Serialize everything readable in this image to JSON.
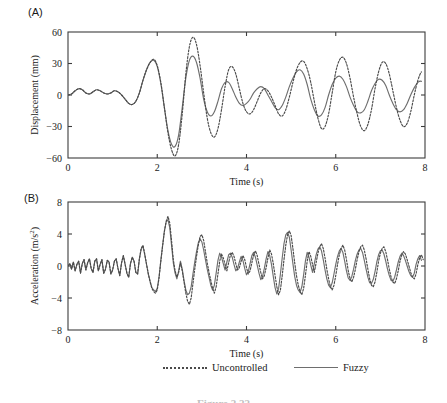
{
  "figure": {
    "caption": "Figure 2.22",
    "panels": [
      {
        "id": "A",
        "label": "(A)"
      },
      {
        "id": "B",
        "label": "(B)"
      }
    ]
  },
  "legend": {
    "position": "bottom-center",
    "entries": [
      {
        "label": "Uncontrolled",
        "style": "dotted",
        "color": "#4a4a4a",
        "icon": "dotted-line-icon"
      },
      {
        "label": "Fuzzy",
        "style": "solid",
        "color": "#6e6e6e",
        "icon": "solid-line-icon"
      }
    ]
  },
  "chart_data": [
    {
      "type": "line",
      "panel": "A",
      "title": "",
      "xlabel": "Time (s)",
      "ylabel": "Displacement (mm)",
      "xlim": [
        0,
        8
      ],
      "ylim": [
        -60,
        60
      ],
      "xticks": [
        0,
        2,
        4,
        6,
        8
      ],
      "yticks": [
        -60,
        -30,
        0,
        30,
        60
      ],
      "xticklabels": [
        "0",
        "2",
        "4",
        "6",
        "8"
      ],
      "yticklabels": [
        "-60",
        "-30",
        "0",
        "30",
        "60"
      ],
      "grid": false,
      "legend": [
        "Uncontrolled",
        "Fuzzy"
      ],
      "x": [
        0.0,
        0.08,
        0.16,
        0.24,
        0.32,
        0.4,
        0.48,
        0.56,
        0.64,
        0.72,
        0.8,
        0.88,
        0.96,
        1.04,
        1.12,
        1.2,
        1.28,
        1.36,
        1.44,
        1.52,
        1.6,
        1.68,
        1.76,
        1.84,
        1.92,
        2.0,
        2.08,
        2.16,
        2.24,
        2.32,
        2.4,
        2.48,
        2.56,
        2.64,
        2.72,
        2.8,
        2.88,
        2.96,
        3.04,
        3.12,
        3.2,
        3.28,
        3.36,
        3.44,
        3.52,
        3.6,
        3.68,
        3.76,
        3.84,
        3.92,
        4.0,
        4.08,
        4.16,
        4.24,
        4.32,
        4.4,
        4.48,
        4.56,
        4.64,
        4.72,
        4.8,
        4.88,
        4.96,
        5.04,
        5.12,
        5.2,
        5.28,
        5.36,
        5.44,
        5.52,
        5.6,
        5.68,
        5.76,
        5.84,
        5.92,
        6.0,
        6.08,
        6.16,
        6.24,
        6.32,
        6.4,
        6.48,
        6.56,
        6.64,
        6.72,
        6.8,
        6.88,
        6.96,
        7.04,
        7.12,
        7.2,
        7.28,
        7.36,
        7.44,
        7.52,
        7.6,
        7.68,
        7.76,
        7.84,
        7.92,
        8.0
      ],
      "series": [
        {
          "name": "Uncontrolled",
          "values": [
            0,
            1,
            4,
            6,
            5,
            2,
            1,
            3,
            5,
            4,
            2,
            1,
            2,
            4,
            3,
            0,
            -4,
            -8,
            -9,
            -6,
            2,
            14,
            24,
            31,
            34,
            28,
            12,
            -12,
            -36,
            -52,
            -58,
            -47,
            -18,
            20,
            46,
            55,
            48,
            28,
            2,
            -22,
            -36,
            -40,
            -32,
            -14,
            8,
            24,
            27,
            20,
            6,
            -8,
            -16,
            -18,
            -14,
            -6,
            2,
            6,
            4,
            -2,
            -10,
            -18,
            -20,
            -14,
            -2,
            12,
            24,
            31,
            32,
            25,
            12,
            -6,
            -22,
            -32,
            -30,
            -18,
            2,
            22,
            33,
            36,
            30,
            16,
            -2,
            -18,
            -30,
            -34,
            -28,
            -14,
            6,
            22,
            31,
            30,
            20,
            4,
            -12,
            -24,
            -30,
            -27,
            -16,
            0,
            14,
            22,
            24,
            18,
            4
          ]
        },
        {
          "name": "Fuzzy",
          "values": [
            0,
            1,
            4,
            6,
            5,
            2,
            1,
            3,
            5,
            4,
            2,
            1,
            2,
            4,
            3,
            0,
            -4,
            -8,
            -9,
            -6,
            2,
            14,
            24,
            31,
            33,
            27,
            11,
            -12,
            -34,
            -47,
            -49,
            -38,
            -12,
            16,
            33,
            37,
            31,
            16,
            -4,
            -16,
            -20,
            -16,
            -6,
            6,
            12,
            12,
            6,
            -2,
            -8,
            -10,
            -8,
            -4,
            2,
            6,
            8,
            6,
            0,
            -6,
            -12,
            -14,
            -10,
            -2,
            8,
            16,
            22,
            24,
            20,
            10,
            -4,
            -14,
            -20,
            -19,
            -12,
            0,
            10,
            16,
            18,
            15,
            8,
            -2,
            -10,
            -16,
            -17,
            -14,
            -6,
            4,
            11,
            15,
            14,
            9,
            0,
            -8,
            -14,
            -16,
            -14,
            -8,
            0,
            7,
            12,
            13,
            9,
            1
          ]
        }
      ]
    },
    {
      "type": "line",
      "panel": "B",
      "title": "",
      "xlabel": "Time (s)",
      "ylabel": "Acceleration (m/s²)",
      "xlim": [
        0,
        8
      ],
      "ylim": [
        -8,
        8
      ],
      "xticks": [
        0,
        2,
        4,
        6,
        8
      ],
      "yticks": [
        -8,
        -4,
        0,
        4,
        8
      ],
      "xticklabels": [
        "0",
        "2",
        "4",
        "6",
        "8"
      ],
      "yticklabels": [
        "-8",
        "-4",
        "0",
        "4",
        "8"
      ],
      "grid": false,
      "legend": [
        "Uncontrolled",
        "Fuzzy"
      ],
      "x": [
        0.0,
        0.04,
        0.08,
        0.12,
        0.16,
        0.2,
        0.24,
        0.28,
        0.32,
        0.36,
        0.4,
        0.44,
        0.48,
        0.52,
        0.56,
        0.6,
        0.64,
        0.68,
        0.72,
        0.76,
        0.8,
        0.84,
        0.88,
        0.92,
        0.96,
        1.0,
        1.04,
        1.08,
        1.12,
        1.16,
        1.2,
        1.24,
        1.28,
        1.32,
        1.36,
        1.4,
        1.44,
        1.48,
        1.52,
        1.56,
        1.6,
        1.64,
        1.68,
        1.72,
        1.76,
        1.8,
        1.84,
        1.88,
        1.92,
        1.96,
        2.0,
        2.04,
        2.08,
        2.12,
        2.16,
        2.2,
        2.24,
        2.28,
        2.32,
        2.36,
        2.4,
        2.44,
        2.48,
        2.52,
        2.56,
        2.6,
        2.64,
        2.68,
        2.72,
        2.76,
        2.8,
        2.84,
        2.88,
        2.92,
        2.96,
        3.0,
        3.04,
        3.08,
        3.12,
        3.16,
        3.2,
        3.24,
        3.28,
        3.32,
        3.36,
        3.4,
        3.44,
        3.48,
        3.52,
        3.56,
        3.6,
        3.64,
        3.68,
        3.72,
        3.76,
        3.8,
        3.84,
        3.88,
        3.92,
        3.96,
        4.0,
        4.04,
        4.08,
        4.12,
        4.16,
        4.2,
        4.24,
        4.28,
        4.32,
        4.36,
        4.4,
        4.44,
        4.48,
        4.52,
        4.56,
        4.6,
        4.64,
        4.68,
        4.72,
        4.76,
        4.8,
        4.84,
        4.88,
        4.92,
        4.96,
        5.0,
        5.04,
        5.08,
        5.12,
        5.16,
        5.2,
        5.24,
        5.28,
        5.32,
        5.36,
        5.4,
        5.44,
        5.48,
        5.52,
        5.56,
        5.6,
        5.64,
        5.68,
        5.72,
        5.76,
        5.8,
        5.84,
        5.88,
        5.92,
        5.96,
        6.0,
        6.04,
        6.08,
        6.12,
        6.16,
        6.2,
        6.24,
        6.28,
        6.32,
        6.36,
        6.4,
        6.44,
        6.48,
        6.52,
        6.56,
        6.6,
        6.64,
        6.68,
        6.72,
        6.76,
        6.8,
        6.84,
        6.88,
        6.92,
        6.96,
        7.0,
        7.04,
        7.08,
        7.12,
        7.16,
        7.2,
        7.24,
        7.28,
        7.32,
        7.36,
        7.4,
        7.44,
        7.48,
        7.52,
        7.56,
        7.6,
        7.64,
        7.68,
        7.72,
        7.76,
        7.8,
        7.84,
        7.88,
        7.92,
        7.96,
        8.0
      ],
      "series": [
        {
          "name": "Uncontrolled",
          "values": [
            0,
            0.3,
            -0.4,
            0.5,
            -0.6,
            0.2,
            0.6,
            -0.9,
            0.3,
            0.8,
            -0.5,
            0.4,
            0.9,
            -0.3,
            -0.8,
            0.6,
            0.9,
            -0.6,
            0.2,
            0.8,
            -0.9,
            -0.4,
            0.7,
            0.5,
            -1.0,
            -0.5,
            0.6,
            0.9,
            -0.3,
            -1.2,
            0.4,
            1.3,
            0.2,
            -0.9,
            -1.4,
            0.3,
            1.1,
            0.6,
            -0.8,
            -1.0,
            0.9,
            2.2,
            2.6,
            1.5,
            0.2,
            -1.0,
            -2.0,
            -2.8,
            -3.2,
            -3.4,
            -3.0,
            -1.5,
            0.6,
            2.5,
            4.3,
            5.6,
            6.2,
            5.4,
            3.2,
            0.8,
            -0.6,
            -1.4,
            -0.8,
            0.4,
            -0.6,
            -2.0,
            -3.4,
            -4.4,
            -4.8,
            -4.0,
            -2.2,
            -0.4,
            1.2,
            2.6,
            3.7,
            3.9,
            3.2,
            1.8,
            0.4,
            -0.8,
            -1.8,
            -2.8,
            -3.4,
            -2.6,
            -1.0,
            0.6,
            1.5,
            1.0,
            0.2,
            -0.6,
            0.4,
            1.4,
            1.7,
            1.2,
            0.3,
            -0.5,
            -0.2,
            0.6,
            1.3,
            0.8,
            -0.2,
            -1.0,
            -0.6,
            0.4,
            1.4,
            1.9,
            1.3,
            0.2,
            -0.8,
            -1.6,
            -1.2,
            -0.2,
            1.0,
            2.0,
            1.5,
            0.3,
            -1.2,
            -2.6,
            -3.6,
            -3.0,
            -1.2,
            0.8,
            2.6,
            3.9,
            4.4,
            3.8,
            2.2,
            0.4,
            -1.2,
            -2.4,
            -3.2,
            -3.6,
            -2.8,
            -1.2,
            0.6,
            1.8,
            1.2,
            0.2,
            -0.8,
            0.4,
            1.6,
            2.4,
            2.8,
            2.2,
            1.0,
            -0.4,
            -1.6,
            -2.6,
            -3.0,
            -2.4,
            -1.2,
            0.2,
            1.4,
            2.2,
            2.6,
            2.0,
            0.8,
            -0.6,
            -1.6,
            -2.0,
            -1.4,
            -0.4,
            0.8,
            1.8,
            2.4,
            2.6,
            2.0,
            0.9,
            -0.4,
            -1.6,
            -2.4,
            -2.6,
            -2.0,
            -0.8,
            0.6,
            1.6,
            2.2,
            2.4,
            1.8,
            0.8,
            -0.4,
            -1.4,
            -2.0,
            -2.2,
            -1.6,
            -0.6,
            0.6,
            1.4,
            1.8,
            1.5,
            0.8,
            0,
            -0.8,
            -1.4,
            -1.6,
            -1.0,
            0.2,
            1.0,
            1.4,
            0.8
          ]
        },
        {
          "name": "Fuzzy",
          "values": [
            0,
            0.3,
            -0.4,
            0.5,
            -0.6,
            0.2,
            0.6,
            -0.9,
            0.3,
            0.8,
            -0.5,
            0.4,
            0.9,
            -0.3,
            -0.8,
            0.6,
            0.9,
            -0.6,
            0.2,
            0.8,
            -0.9,
            -0.4,
            0.7,
            0.5,
            -1.0,
            -0.5,
            0.6,
            0.9,
            -0.3,
            -1.2,
            0.4,
            1.3,
            0.2,
            -0.9,
            -1.4,
            0.3,
            1.1,
            0.6,
            -0.8,
            -1.0,
            0.9,
            2.1,
            2.5,
            1.4,
            0.2,
            -1.0,
            -1.9,
            -2.7,
            -3.0,
            -3.2,
            -2.8,
            -1.4,
            0.7,
            2.6,
            4.4,
            5.5,
            5.8,
            4.8,
            2.6,
            0.4,
            -0.9,
            -1.6,
            -0.6,
            0.6,
            -0.4,
            -1.8,
            -3.0,
            -3.6,
            -3.4,
            -2.6,
            -1.0,
            0.5,
            1.8,
            2.9,
            3.4,
            3.0,
            2.0,
            0.8,
            -0.4,
            -1.4,
            -2.4,
            -3.0,
            -2.4,
            -0.9,
            0.7,
            1.6,
            1.1,
            0.3,
            -0.5,
            0.5,
            1.4,
            1.6,
            1.1,
            0.2,
            -0.6,
            -0.3,
            0.5,
            1.2,
            0.7,
            -0.3,
            -1.1,
            -0.7,
            0.3,
            1.3,
            1.7,
            1.1,
            0.1,
            -0.9,
            -1.7,
            -1.3,
            -0.3,
            0.9,
            1.8,
            1.3,
            0.2,
            -1.3,
            -2.7,
            -3.5,
            -2.8,
            -1.0,
            1.0,
            2.8,
            3.9,
            4.2,
            3.6,
            2.0,
            0.3,
            -1.3,
            -2.4,
            -3.0,
            -3.3,
            -2.6,
            -1.1,
            0.6,
            1.7,
            1.1,
            0.1,
            -0.8,
            0.3,
            1.4,
            2.1,
            2.4,
            1.9,
            0.8,
            -0.5,
            -1.6,
            -2.4,
            -2.7,
            -2.1,
            -1.0,
            0.2,
            1.2,
            1.9,
            2.2,
            1.7,
            0.6,
            -0.6,
            -1.5,
            -1.8,
            -1.3,
            -0.4,
            0.7,
            1.5,
            2.0,
            2.2,
            1.7,
            0.7,
            -0.4,
            -1.4,
            -2.1,
            -2.2,
            -1.7,
            -0.7,
            0.5,
            1.4,
            1.9,
            2.0,
            1.5,
            0.6,
            -0.4,
            -1.2,
            -1.8,
            -1.9,
            -1.4,
            -0.5,
            0.5,
            1.2,
            1.6,
            1.3,
            0.7,
            0,
            -0.7,
            -1.2,
            -1.4,
            -0.9,
            0.2,
            0.9,
            1.3,
            0.7
          ]
        }
      ]
    }
  ]
}
